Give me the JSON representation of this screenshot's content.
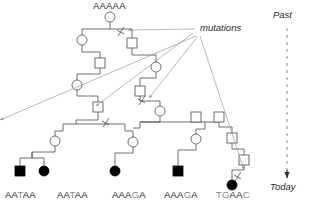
{
  "figure": {
    "type": "pedigree-coalescent-diagram",
    "founder_label": "AAAAA",
    "mutations_label": "mutations",
    "axis": {
      "past_label": "Past",
      "today_label": "Today"
    }
  },
  "colors": {
    "line": "#4a4a4a",
    "node_stroke": "#4a4a4a",
    "node_fill": "#ffffff",
    "affected_fill": "#000000",
    "arrow": "#9a9a9a",
    "dashed_axis": "#8a8a8a",
    "text": "#1a1a1a",
    "mutated_base": "#8a8a8a"
  },
  "sequences": [
    {
      "id": "seq-1",
      "x": 5,
      "chars": [
        {
          "c": "A",
          "mutated": false
        },
        {
          "c": "A",
          "mutated": false
        },
        {
          "c": "T",
          "mutated": true
        },
        {
          "c": "A",
          "mutated": false
        },
        {
          "c": "A",
          "mutated": false
        }
      ]
    },
    {
      "id": "seq-2",
      "x": 57,
      "chars": [
        {
          "c": "A",
          "mutated": false
        },
        {
          "c": "A",
          "mutated": false
        },
        {
          "c": "T",
          "mutated": true
        },
        {
          "c": "A",
          "mutated": false
        },
        {
          "c": "A",
          "mutated": false
        }
      ]
    },
    {
      "id": "seq-3",
      "x": 112,
      "chars": [
        {
          "c": "A",
          "mutated": false
        },
        {
          "c": "A",
          "mutated": false
        },
        {
          "c": "A",
          "mutated": false
        },
        {
          "c": "G",
          "mutated": true
        },
        {
          "c": "A",
          "mutated": false
        }
      ]
    },
    {
      "id": "seq-4",
      "x": 164,
      "chars": [
        {
          "c": "A",
          "mutated": false
        },
        {
          "c": "A",
          "mutated": false
        },
        {
          "c": "A",
          "mutated": false
        },
        {
          "c": "G",
          "mutated": true
        },
        {
          "c": "A",
          "mutated": false
        }
      ]
    },
    {
      "id": "seq-5",
      "x": 216,
      "chars": [
        {
          "c": "T",
          "mutated": true
        },
        {
          "c": "G",
          "mutated": true
        },
        {
          "c": "A",
          "mutated": false
        },
        {
          "c": "A",
          "mutated": false
        },
        {
          "c": "C",
          "mutated": true
        }
      ]
    }
  ],
  "counts": {
    "mutation_markers": 4,
    "mutation_arrows": 5,
    "sampled_individuals": 6
  }
}
